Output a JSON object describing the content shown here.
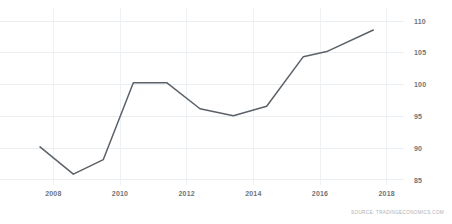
{
  "chart_data": {
    "type": "line",
    "title": "",
    "subtitle": "",
    "xlabel": "",
    "ylabel": "",
    "xlim": [
      2007.3,
      2018.4
    ],
    "ylim": [
      84.2,
      110.8
    ],
    "grid": true,
    "legend": null,
    "legend_position": "none",
    "line_color": "#5b6168",
    "x_ticks": [
      "2008",
      "2010",
      "2012",
      "2014",
      "2016",
      "2018"
    ],
    "x_tick_values": [
      2008,
      2010,
      2012,
      2014,
      2016,
      2018
    ],
    "y_ticks": [
      "85",
      "90",
      "95",
      "100",
      "105",
      "110"
    ],
    "y_tick_values": [
      85,
      90,
      95,
      100,
      105,
      110
    ],
    "x": [
      2007.6,
      2008.6,
      2009.5,
      2010.4,
      2011.4,
      2012.4,
      2013.4,
      2014.4,
      2015.5,
      2016.2,
      2017.6
    ],
    "values": [
      90.2,
      85.9,
      88.2,
      100.3,
      100.3,
      96.2,
      95.1,
      96.6,
      104.4,
      105.2,
      108.6
    ],
    "series": [
      {
        "name": "Index",
        "values": [
          90.2,
          85.9,
          88.2,
          100.3,
          100.3,
          96.2,
          95.1,
          96.6,
          104.4,
          105.2,
          108.6
        ]
      }
    ],
    "annotations": []
  },
  "footer": {
    "source": "SOURCE: TRADINGECONOMICS.COM"
  }
}
